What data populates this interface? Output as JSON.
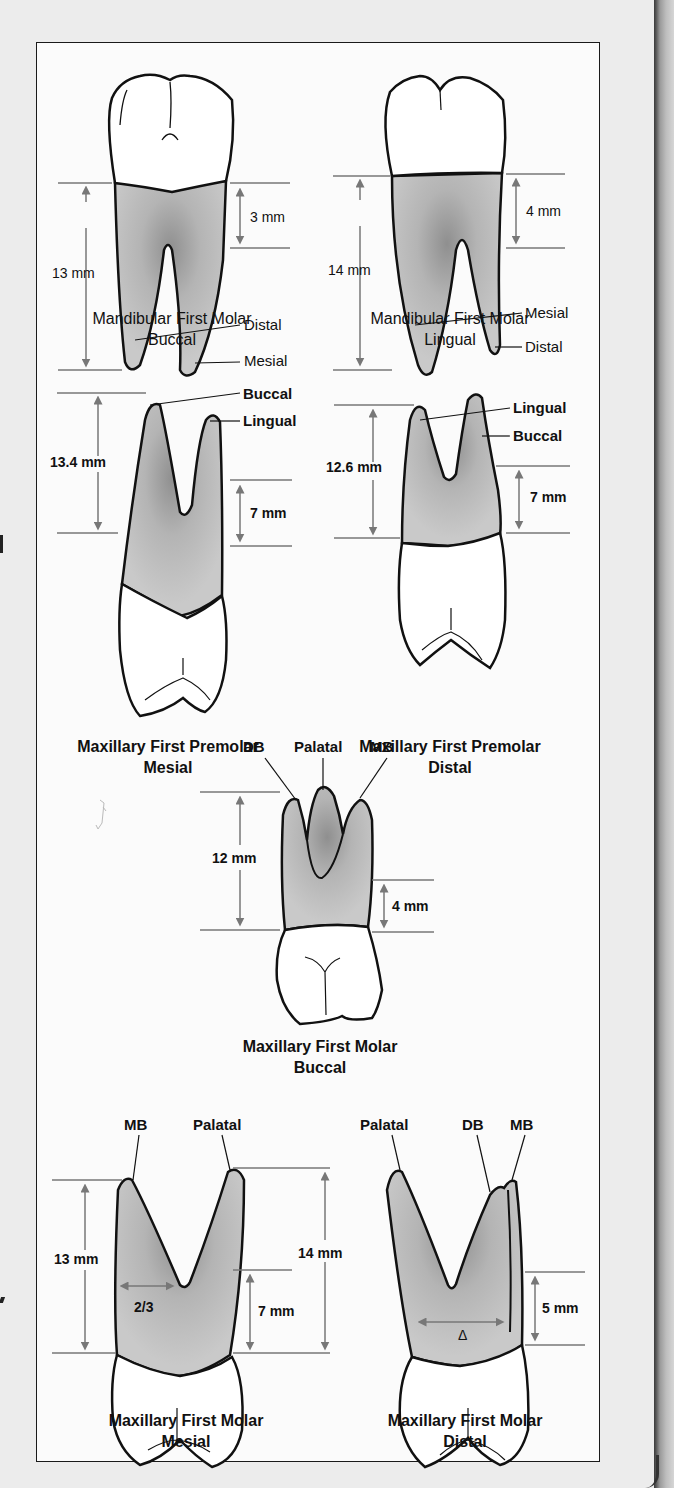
{
  "figure": {
    "panels": [
      {
        "id": "mandibular-first-molar-buccal",
        "caption_line1": "Mandibular First Molar",
        "caption_line2": "Buccal",
        "caption_bold": false,
        "measurements": {
          "root_length": "13 mm",
          "root_trunk": "3 mm"
        },
        "root_labels": [
          "Distal",
          "Mesial"
        ]
      },
      {
        "id": "mandibular-first-molar-lingual",
        "caption_line1": "Mandibular First Molar",
        "caption_line2": "Lingual",
        "caption_bold": false,
        "measurements": {
          "root_length": "14 mm",
          "root_trunk": "4 mm"
        },
        "root_labels": [
          "Mesial",
          "Distal"
        ]
      },
      {
        "id": "maxillary-first-premolar-mesial",
        "caption_line1": "Maxillary First Premolar",
        "caption_line2": "Mesial",
        "caption_bold": true,
        "measurements": {
          "root_length": "13.4 mm",
          "root_trunk": "7 mm"
        },
        "root_labels": [
          "Buccal",
          "Lingual"
        ]
      },
      {
        "id": "maxillary-first-premolar-distal",
        "caption_line1": "Maxillary First Premolar",
        "caption_line2": "Distal",
        "caption_bold": true,
        "measurements": {
          "root_length": "12.6 mm",
          "root_trunk": "7 mm"
        },
        "root_labels": [
          "Lingual",
          "Buccal"
        ]
      },
      {
        "id": "maxillary-first-molar-buccal",
        "caption_line1": "Maxillary First Molar",
        "caption_line2": "Buccal",
        "caption_bold": false,
        "measurements": {
          "root_length": "12 mm",
          "root_trunk": "4 mm"
        },
        "root_labels": [
          "DB",
          "Palatal",
          "MB"
        ]
      },
      {
        "id": "maxillary-first-molar-mesial",
        "caption_line1": "Maxillary First Molar",
        "caption_line2": "Mesial",
        "caption_bold": false,
        "measurements": {
          "mb_root_length": "13 mm",
          "palatal_root_length": "14 mm",
          "root_trunk": "7 mm",
          "fraction": "2/3"
        },
        "root_labels": [
          "MB",
          "Palatal"
        ]
      },
      {
        "id": "maxillary-first-molar-distal",
        "caption_line1": "Maxillary First Molar",
        "caption_line2": "Distal",
        "caption_bold": false,
        "measurements": {
          "root_trunk": "5 mm",
          "delta_symbol": "Δ"
        },
        "root_labels": [
          "Palatal",
          "DB",
          "MB"
        ]
      }
    ]
  },
  "colors": {
    "page_background": "#ececec",
    "frame_background": "#fbfbfb",
    "root_fill": "#b8b8b8",
    "root_dark": "#8c8c8c",
    "outline": "#111111",
    "measure_line": "#777777"
  }
}
